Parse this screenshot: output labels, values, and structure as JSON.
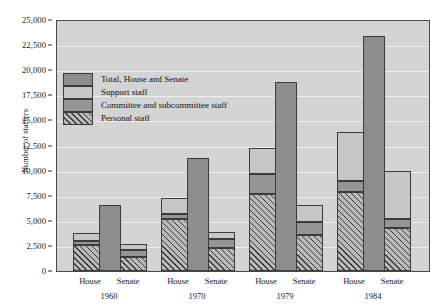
{
  "chart_data": {
    "type": "bar",
    "title": "",
    "subtitle": "",
    "xlabel": "",
    "ylabel": "Number of staffers",
    "ylim": [
      0,
      25000
    ],
    "ytick_labels": [
      "0",
      "2,500",
      "5,000",
      "7,500",
      "10,000",
      "12,500",
      "15,000",
      "17,500",
      "20,000",
      "22,500",
      "25,000"
    ],
    "ytick_values": [
      0,
      2500,
      5000,
      7500,
      10000,
      12500,
      15000,
      17500,
      20000,
      22500,
      25000
    ],
    "grid": true,
    "legend_position": "upper-left-inside",
    "categories": [
      "1960",
      "1970",
      "1979",
      "1984"
    ],
    "chambers": [
      "House",
      "Senate"
    ],
    "legend": [
      {
        "key": "total",
        "label": "Total, House and Senate",
        "color": "#8d8d8d"
      },
      {
        "key": "support",
        "label": "Support staff",
        "color": "#c6c6c6"
      },
      {
        "key": "committee",
        "label": "Committee and subcommittee staff",
        "color": "#959595"
      },
      {
        "key": "personal",
        "label": "Personal staff",
        "color": "#b9b9b9",
        "hatch": "diagonal"
      }
    ],
    "series": [
      {
        "name": "Personal staff",
        "key": "personal",
        "House": [
          2600,
          5200,
          7700,
          7900
        ],
        "Senate": [
          1400,
          2300,
          3600,
          4300
        ]
      },
      {
        "name": "Committee and subcommittee staff",
        "key": "committee",
        "House": [
          400,
          500,
          2000,
          1100
        ],
        "Senate": [
          700,
          900,
          1300,
          900
        ]
      },
      {
        "name": "Support staff",
        "key": "support",
        "House": [
          800,
          1600,
          2600,
          4800
        ],
        "Senate": [
          600,
          700,
          1700,
          4800
        ]
      }
    ],
    "chamber_totals": {
      "House": [
        3800,
        7300,
        12300,
        13800
      ],
      "Senate": [
        2700,
        3900,
        6600,
        10000
      ]
    },
    "combined_totals": [
      6600,
      11300,
      18800,
      23400
    ]
  }
}
